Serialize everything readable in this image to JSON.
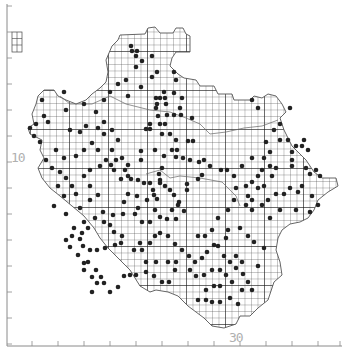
{
  "map": {
    "title": "",
    "type": "distribution grid map",
    "colors": {
      "background": "#ffffff",
      "grid": "#3a3a3a",
      "major_grid": "#1a1a1a",
      "outline": "#555555",
      "dot": "#222222",
      "axis": "#8a8a8a",
      "axis_label": "#b0b0b0"
    },
    "axes": {
      "y_label": "10",
      "x_label": "30",
      "y_ticks_px": [
        6,
        32,
        58,
        84,
        110,
        136,
        162,
        188,
        214,
        240,
        266,
        292,
        318,
        344
      ],
      "x_ticks_px": [
        32,
        58,
        84,
        110,
        136,
        162,
        188,
        214,
        240,
        266,
        292,
        318,
        340
      ]
    },
    "grid": {
      "cell_px": 6.5,
      "origin_x": 30,
      "origin_y": 12
    },
    "outline": [
      [
        120,
        35
      ],
      [
        145,
        34
      ],
      [
        148,
        28
      ],
      [
        155,
        27
      ],
      [
        160,
        33
      ],
      [
        173,
        33
      ],
      [
        176,
        28
      ],
      [
        183,
        28
      ],
      [
        186,
        34
      ],
      [
        190,
        36
      ],
      [
        190,
        52
      ],
      [
        176,
        52
      ],
      [
        172,
        58
      ],
      [
        170,
        66
      ],
      [
        178,
        74
      ],
      [
        184,
        78
      ],
      [
        196,
        80
      ],
      [
        200,
        86
      ],
      [
        214,
        86
      ],
      [
        218,
        94
      ],
      [
        232,
        94
      ],
      [
        234,
        100
      ],
      [
        250,
        100
      ],
      [
        254,
        96
      ],
      [
        262,
        98
      ],
      [
        268,
        94
      ],
      [
        276,
        96
      ],
      [
        282,
        104
      ],
      [
        286,
        112
      ],
      [
        280,
        118
      ],
      [
        284,
        130
      ],
      [
        292,
        146
      ],
      [
        298,
        152
      ],
      [
        306,
        160
      ],
      [
        314,
        172
      ],
      [
        322,
        178
      ],
      [
        336,
        178
      ],
      [
        338,
        186
      ],
      [
        328,
        192
      ],
      [
        318,
        200
      ],
      [
        314,
        210
      ],
      [
        308,
        218
      ],
      [
        300,
        222
      ],
      [
        290,
        224
      ],
      [
        282,
        230
      ],
      [
        278,
        238
      ],
      [
        276,
        250
      ],
      [
        280,
        262
      ],
      [
        282,
        275
      ],
      [
        274,
        282
      ],
      [
        268,
        300
      ],
      [
        258,
        308
      ],
      [
        250,
        316
      ],
      [
        240,
        316
      ],
      [
        236,
        324
      ],
      [
        224,
        328
      ],
      [
        212,
        326
      ],
      [
        204,
        318
      ],
      [
        196,
        312
      ],
      [
        188,
        306
      ],
      [
        178,
        296
      ],
      [
        168,
        292
      ],
      [
        156,
        290
      ],
      [
        150,
        292
      ],
      [
        140,
        286
      ],
      [
        130,
        270
      ],
      [
        118,
        258
      ],
      [
        108,
        248
      ],
      [
        100,
        238
      ],
      [
        94,
        228
      ],
      [
        84,
        216
      ],
      [
        72,
        206
      ],
      [
        60,
        196
      ],
      [
        50,
        188
      ],
      [
        42,
        178
      ],
      [
        38,
        168
      ],
      [
        44,
        158
      ],
      [
        40,
        150
      ],
      [
        42,
        140
      ],
      [
        30,
        134
      ],
      [
        28,
        128
      ],
      [
        34,
        124
      ],
      [
        32,
        114
      ],
      [
        36,
        104
      ],
      [
        38,
        96
      ],
      [
        44,
        90
      ],
      [
        54,
        90
      ],
      [
        58,
        96
      ],
      [
        66,
        100
      ],
      [
        76,
        104
      ],
      [
        86,
        100
      ],
      [
        92,
        94
      ],
      [
        100,
        88
      ],
      [
        106,
        82
      ],
      [
        108,
        72
      ],
      [
        106,
        60
      ],
      [
        112,
        46
      ],
      [
        118,
        40
      ]
    ],
    "inset_box": {
      "x": 12,
      "y": 32,
      "w": 10,
      "h": 20
    },
    "dots": [
      [
        131,
        46
      ],
      [
        132,
        51
      ],
      [
        137,
        51
      ],
      [
        136,
        56
      ],
      [
        142,
        61
      ],
      [
        152,
        56
      ],
      [
        136,
        67
      ],
      [
        152,
        77
      ],
      [
        141,
        87
      ],
      [
        157,
        72
      ],
      [
        174,
        72
      ],
      [
        176,
        80
      ],
      [
        164,
        92
      ],
      [
        174,
        93
      ],
      [
        156,
        98
      ],
      [
        157,
        104
      ],
      [
        156,
        108
      ],
      [
        160,
        98
      ],
      [
        165,
        98
      ],
      [
        166,
        104
      ],
      [
        182,
        98
      ],
      [
        180,
        108
      ],
      [
        192,
        118
      ],
      [
        174,
        115
      ],
      [
        181,
        115
      ],
      [
        167,
        115
      ],
      [
        158,
        116
      ],
      [
        160,
        124
      ],
      [
        165,
        124
      ],
      [
        150,
        124
      ],
      [
        146,
        129
      ],
      [
        150,
        129
      ],
      [
        162,
        134
      ],
      [
        170,
        134
      ],
      [
        176,
        140
      ],
      [
        188,
        141
      ],
      [
        193,
        141
      ],
      [
        172,
        150
      ],
      [
        177,
        150
      ],
      [
        155,
        150
      ],
      [
        141,
        151
      ],
      [
        141,
        160
      ],
      [
        164,
        156
      ],
      [
        176,
        157
      ],
      [
        183,
        158
      ],
      [
        190,
        160
      ],
      [
        199,
        162
      ],
      [
        204,
        160
      ],
      [
        210,
        166
      ],
      [
        221,
        170
      ],
      [
        227,
        170
      ],
      [
        202,
        175
      ],
      [
        198,
        179
      ],
      [
        187,
        184
      ],
      [
        187,
        190
      ],
      [
        174,
        195
      ],
      [
        170,
        190
      ],
      [
        165,
        186
      ],
      [
        160,
        183
      ],
      [
        159,
        174
      ],
      [
        162,
        168
      ],
      [
        179,
        202
      ],
      [
        184,
        211
      ],
      [
        178,
        205
      ],
      [
        172,
        210
      ],
      [
        155,
        210
      ],
      [
        160,
        217
      ],
      [
        176,
        219
      ],
      [
        167,
        219
      ],
      [
        142,
        222
      ],
      [
        150,
        222
      ],
      [
        122,
        158
      ],
      [
        116,
        160
      ],
      [
        128,
        165
      ],
      [
        114,
        170
      ],
      [
        111,
        165
      ],
      [
        125,
        170
      ],
      [
        128,
        176
      ],
      [
        121,
        179
      ],
      [
        131,
        179
      ],
      [
        138,
        180
      ],
      [
        144,
        183
      ],
      [
        150,
        183
      ],
      [
        160,
        180
      ],
      [
        153,
        190
      ],
      [
        157,
        199
      ],
      [
        154,
        195
      ],
      [
        147,
        200
      ],
      [
        137,
        196
      ],
      [
        128,
        194
      ],
      [
        124,
        202
      ],
      [
        138,
        208
      ],
      [
        135,
        214
      ],
      [
        123,
        214
      ],
      [
        113,
        215
      ],
      [
        103,
        212
      ],
      [
        95,
        218
      ],
      [
        104,
        222
      ],
      [
        110,
        225
      ],
      [
        114,
        232
      ],
      [
        122,
        236
      ],
      [
        121,
        243
      ],
      [
        115,
        245
      ],
      [
        105,
        248
      ],
      [
        97,
        250
      ],
      [
        90,
        250
      ],
      [
        83,
        246
      ],
      [
        80,
        239
      ],
      [
        82,
        233
      ],
      [
        88,
        228
      ],
      [
        74,
        228
      ],
      [
        72,
        236
      ],
      [
        66,
        240
      ],
      [
        70,
        247
      ],
      [
        78,
        255
      ],
      [
        88,
        262
      ],
      [
        96,
        270
      ],
      [
        101,
        277
      ],
      [
        104,
        283
      ],
      [
        97,
        283
      ],
      [
        92,
        277
      ],
      [
        84,
        270
      ],
      [
        84,
        263
      ],
      [
        92,
        292
      ],
      [
        110,
        292
      ],
      [
        118,
        287
      ],
      [
        124,
        276
      ],
      [
        130,
        275
      ],
      [
        136,
        275
      ],
      [
        146,
        272
      ],
      [
        154,
        276
      ],
      [
        162,
        282
      ],
      [
        169,
        282
      ],
      [
        175,
        270
      ],
      [
        176,
        262
      ],
      [
        168,
        262
      ],
      [
        156,
        262
      ],
      [
        146,
        262
      ],
      [
        142,
        250
      ],
      [
        134,
        250
      ],
      [
        140,
        243
      ],
      [
        150,
        243
      ],
      [
        155,
        236
      ],
      [
        160,
        233
      ],
      [
        168,
        236
      ],
      [
        175,
        244
      ],
      [
        182,
        250
      ],
      [
        189,
        256
      ],
      [
        195,
        262
      ],
      [
        202,
        258
      ],
      [
        207,
        252
      ],
      [
        214,
        245
      ],
      [
        224,
        256
      ],
      [
        230,
        262
      ],
      [
        236,
        268
      ],
      [
        243,
        274
      ],
      [
        248,
        282
      ],
      [
        252,
        290
      ],
      [
        242,
        290
      ],
      [
        230,
        298
      ],
      [
        220,
        302
      ],
      [
        212,
        302
      ],
      [
        206,
        300
      ],
      [
        198,
        300
      ],
      [
        206,
        290
      ],
      [
        214,
        286
      ],
      [
        220,
        286
      ],
      [
        232,
        282
      ],
      [
        226,
        275
      ],
      [
        220,
        270
      ],
      [
        212,
        270
      ],
      [
        204,
        275
      ],
      [
        196,
        276
      ],
      [
        190,
        270
      ],
      [
        198,
        236
      ],
      [
        205,
        236
      ],
      [
        212,
        230
      ],
      [
        218,
        218
      ],
      [
        228,
        210
      ],
      [
        234,
        200
      ],
      [
        248,
        196
      ],
      [
        246,
        186
      ],
      [
        252,
        182
      ],
      [
        258,
        176
      ],
      [
        262,
        170
      ],
      [
        270,
        166
      ],
      [
        276,
        168
      ],
      [
        272,
        176
      ],
      [
        264,
        186
      ],
      [
        258,
        188
      ],
      [
        252,
        200
      ],
      [
        246,
        205
      ],
      [
        262,
        205
      ],
      [
        268,
        200
      ],
      [
        276,
        194
      ],
      [
        284,
        194
      ],
      [
        290,
        188
      ],
      [
        298,
        192
      ],
      [
        302,
        186
      ],
      [
        310,
        174
      ],
      [
        316,
        170
      ],
      [
        320,
        176
      ],
      [
        306,
        168
      ],
      [
        292,
        166
      ],
      [
        292,
        160
      ],
      [
        292,
        152
      ],
      [
        296,
        146
      ],
      [
        302,
        146
      ],
      [
        308,
        150
      ],
      [
        304,
        140
      ],
      [
        288,
        140
      ],
      [
        280,
        140
      ],
      [
        274,
        130
      ],
      [
        280,
        124
      ],
      [
        290,
        108
      ],
      [
        258,
        108
      ],
      [
        252,
        100
      ],
      [
        266,
        142
      ],
      [
        270,
        152
      ],
      [
        264,
        158
      ],
      [
        252,
        158
      ],
      [
        242,
        166
      ],
      [
        234,
        176
      ],
      [
        236,
        188
      ],
      [
        228,
        230
      ],
      [
        226,
        238
      ],
      [
        218,
        246
      ],
      [
        236,
        256
      ],
      [
        254,
        242
      ],
      [
        248,
        236
      ],
      [
        240,
        228
      ],
      [
        242,
        262
      ],
      [
        238,
        304
      ],
      [
        258,
        266
      ],
      [
        264,
        248
      ],
      [
        252,
        210
      ],
      [
        270,
        218
      ],
      [
        280,
        210
      ],
      [
        296,
        210
      ],
      [
        310,
        212
      ],
      [
        318,
        205
      ],
      [
        312,
        196
      ],
      [
        64,
        92
      ],
      [
        66,
        110
      ],
      [
        42,
        100
      ],
      [
        44,
        116
      ],
      [
        48,
        122
      ],
      [
        70,
        130
      ],
      [
        80,
        132
      ],
      [
        86,
        126
      ],
      [
        98,
        128
      ],
      [
        104,
        134
      ],
      [
        92,
        143
      ],
      [
        84,
        150
      ],
      [
        76,
        156
      ],
      [
        64,
        158
      ],
      [
        56,
        150
      ],
      [
        46,
        160
      ],
      [
        52,
        168
      ],
      [
        60,
        172
      ],
      [
        66,
        178
      ],
      [
        72,
        186
      ],
      [
        76,
        194
      ],
      [
        90,
        200
      ],
      [
        98,
        195
      ],
      [
        90,
        186
      ],
      [
        84,
        176
      ],
      [
        90,
        170
      ],
      [
        100,
        166
      ],
      [
        106,
        160
      ],
      [
        98,
        150
      ],
      [
        112,
        150
      ],
      [
        118,
        140
      ],
      [
        112,
        130
      ],
      [
        104,
        122
      ],
      [
        96,
        112
      ],
      [
        84,
        104
      ],
      [
        104,
        100
      ],
      [
        110,
        92
      ],
      [
        118,
        84
      ],
      [
        126,
        80
      ],
      [
        128,
        96
      ],
      [
        36,
        124
      ],
      [
        34,
        136
      ],
      [
        30,
        128
      ],
      [
        40,
        142
      ],
      [
        64,
        196
      ],
      [
        58,
        186
      ],
      [
        54,
        206
      ],
      [
        66,
        214
      ],
      [
        80,
        208
      ],
      [
        84,
        222
      ]
    ]
  }
}
